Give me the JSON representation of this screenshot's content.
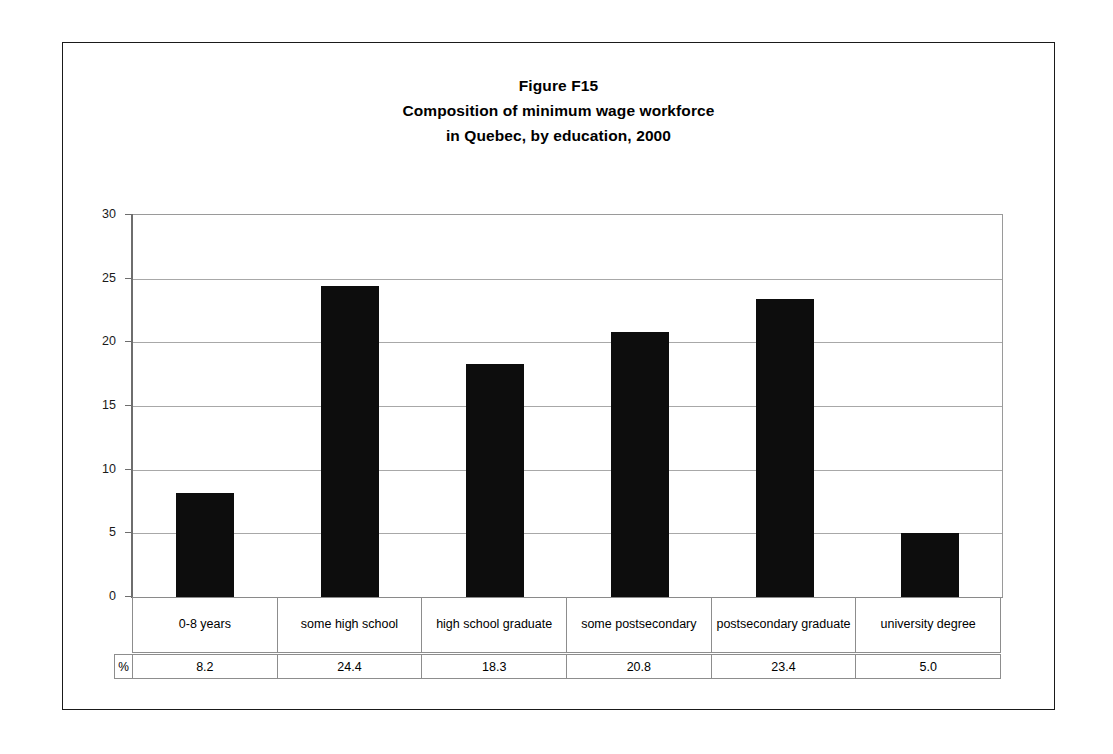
{
  "figure": {
    "title_lines": [
      "Figure F15",
      "Composition of minimum wage workforce",
      "in Quebec, by education, 2000"
    ]
  },
  "chart_data": {
    "type": "bar",
    "xlabel": "",
    "ylabel": "",
    "unit_label": "%",
    "ylim": [
      0,
      30
    ],
    "yticks": [
      0,
      5,
      10,
      15,
      20,
      25,
      30
    ],
    "ytick_labels": [
      "0",
      "5",
      "10",
      "15",
      "20",
      "25",
      "30"
    ],
    "grid": true,
    "legend": false,
    "bar_color": "#0d0d0d",
    "categories": [
      "0-8 years",
      "some high school",
      "high school graduate",
      "some postsecondary",
      "postsecondary graduate",
      "university degree"
    ],
    "values": [
      8.2,
      24.4,
      18.3,
      20.8,
      23.4,
      5.0
    ],
    "value_labels": [
      "8.2",
      "24.4",
      "18.3",
      "20.8",
      "23.4",
      "5.0"
    ]
  }
}
